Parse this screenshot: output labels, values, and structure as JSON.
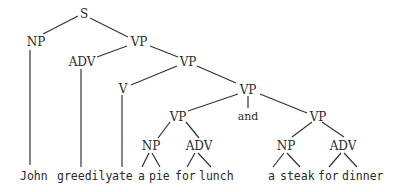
{
  "diagram": {
    "type": "syntax-tree",
    "sentence": "John greedily ate a pie for lunch and a steak for dinner",
    "colors": {
      "ink": "#2a2a2a",
      "background": "#ffffff"
    },
    "nodes": {
      "s": "S",
      "np_subj": "NP",
      "vp1": "VP",
      "adv1": "ADV",
      "vp2": "VP",
      "v": "V",
      "vp3": "VP",
      "vp_left": "VP",
      "conj": "and",
      "vp_right": "VP",
      "np_obj1": "NP",
      "adv_obj1": "ADV",
      "np_obj2": "NP",
      "adv_obj2": "ADV"
    },
    "leaves": {
      "john": "John",
      "greedily": "greedily",
      "ate": "ate",
      "a1": "a",
      "pie": "pie",
      "for1": "for",
      "lunch": "lunch",
      "a2": "a",
      "steak": "steak",
      "for2": "for",
      "dinner": "dinner"
    }
  }
}
